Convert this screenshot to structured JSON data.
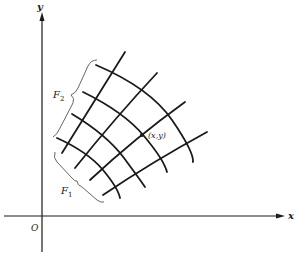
{
  "figure": {
    "axes": {
      "x_label": "x",
      "y_label": "y",
      "origin_label": "O"
    },
    "point_label": "(x,y)",
    "families": [
      {
        "name": "F",
        "subscript": "1"
      },
      {
        "name": "F",
        "subscript": "2"
      }
    ],
    "colors": {
      "ink": "#1a1a1a",
      "brace": "#555555",
      "background": "#ffffff"
    }
  }
}
